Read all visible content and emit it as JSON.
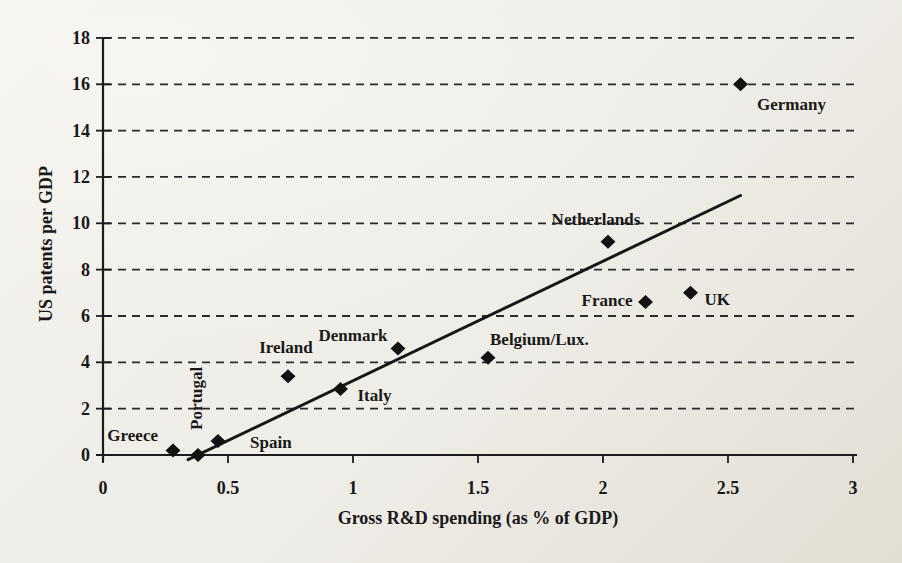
{
  "figure": {
    "background_top": "#f2f0ea",
    "background_bottom": "#e1ded4",
    "ink": "#191919"
  },
  "chart_data": {
    "type": "scatter",
    "title": "",
    "xlabel": "Gross R&D spending (as % of GDP)",
    "ylabel": "US patents per GDP",
    "xlim": [
      0,
      3
    ],
    "ylim": [
      0,
      18
    ],
    "xticks": [
      {
        "value": 0,
        "label": "0"
      },
      {
        "value": 0.5,
        "label": "0.5"
      },
      {
        "value": 1,
        "label": "1"
      },
      {
        "value": 1.5,
        "label": "1.5"
      },
      {
        "value": 2,
        "label": "2"
      },
      {
        "value": 2.5,
        "label": "2.5"
      },
      {
        "value": 3,
        "label": "3"
      }
    ],
    "yticks": [
      {
        "value": 0,
        "label": "0"
      },
      {
        "value": 2,
        "label": "2"
      },
      {
        "value": 4,
        "label": "4"
      },
      {
        "value": 6,
        "label": "6"
      },
      {
        "value": 8,
        "label": "8"
      },
      {
        "value": 10,
        "label": "10"
      },
      {
        "value": 12,
        "label": "12"
      },
      {
        "value": 14,
        "label": "14"
      },
      {
        "value": 16,
        "label": "16"
      },
      {
        "value": 18,
        "label": "18"
      }
    ],
    "grid": {
      "horizontal": true,
      "style": "dashed",
      "vertical": false
    },
    "legend": "none",
    "marker": {
      "shape": "diamond",
      "color": "#121212"
    },
    "points": [
      {
        "label": "Greece",
        "x": 0.28,
        "y": 0.2,
        "anchor": "end",
        "dx": -15,
        "dy": -9,
        "rotate": 0
      },
      {
        "label": "Portugal",
        "x": 0.38,
        "y": 0.0,
        "anchor": "start",
        "dx": 4,
        "dy": -25,
        "rotate": -90
      },
      {
        "label": "Spain",
        "x": 0.46,
        "y": 0.6,
        "anchor": "start",
        "dx": 32,
        "dy": 7,
        "rotate": 0
      },
      {
        "label": "Ireland",
        "x": 0.74,
        "y": 3.4,
        "anchor": "middle",
        "dx": -2,
        "dy": -23,
        "rotate": 0
      },
      {
        "label": "Italy",
        "x": 0.95,
        "y": 2.85,
        "anchor": "start",
        "dx": 17,
        "dy": 12,
        "rotate": 0
      },
      {
        "label": "Denmark",
        "x": 1.18,
        "y": 4.6,
        "anchor": "middle",
        "dx": -45,
        "dy": -7,
        "rotate": 0
      },
      {
        "label": "Belgium/Lux.",
        "x": 1.54,
        "y": 4.2,
        "anchor": "start",
        "dx": 2,
        "dy": -13,
        "rotate": 0
      },
      {
        "label": "Netherlands",
        "x": 2.02,
        "y": 9.2,
        "anchor": "middle",
        "dx": -12,
        "dy": -17,
        "rotate": 0
      },
      {
        "label": "France",
        "x": 2.17,
        "y": 6.6,
        "anchor": "end",
        "dx": -13,
        "dy": 4,
        "rotate": 0
      },
      {
        "label": "UK",
        "x": 2.35,
        "y": 7.0,
        "anchor": "start",
        "dx": 14,
        "dy": 12,
        "rotate": 0
      },
      {
        "label": "Germany",
        "x": 2.55,
        "y": 16.0,
        "anchor": "middle",
        "dx": 51,
        "dy": 26,
        "rotate": 0
      }
    ],
    "trendline": {
      "x1": 0.34,
      "y1": -0.2,
      "x2": 2.55,
      "y2": 11.2
    }
  }
}
